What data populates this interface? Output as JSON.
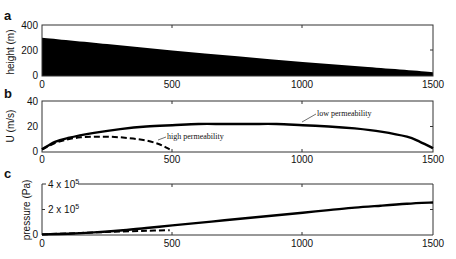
{
  "chart_data": [
    {
      "panel": "a",
      "type": "area",
      "title": "",
      "xlabel": "",
      "ylabel": "height (m)",
      "xlim": [
        0,
        1500
      ],
      "ylim": [
        0,
        400
      ],
      "xticks": [
        0,
        500,
        1000,
        1500
      ],
      "yticks": [
        0,
        200,
        400
      ],
      "grid": false,
      "series": [
        {
          "name": "height",
          "style": "filled-black",
          "x": [
            0,
            250,
            500,
            750,
            1000,
            1250,
            1500
          ],
          "y": [
            300,
            250,
            200,
            155,
            110,
            70,
            30
          ]
        }
      ]
    },
    {
      "panel": "b",
      "type": "line",
      "title": "",
      "xlabel": "",
      "ylabel": "U (m/s)",
      "xlim": [
        0,
        1500
      ],
      "ylim": [
        0,
        40
      ],
      "xticks": [
        0,
        500,
        1000,
        1500
      ],
      "yticks": [
        0,
        20,
        40
      ],
      "grid": false,
      "series": [
        {
          "name": "low permeability",
          "style": "solid",
          "x": [
            0,
            50,
            100,
            200,
            300,
            400,
            500,
            600,
            700,
            800,
            900,
            1000,
            1100,
            1200,
            1300,
            1400,
            1450,
            1500
          ],
          "y": [
            2,
            8,
            11,
            15,
            18,
            20,
            21,
            22,
            22,
            22,
            22,
            21,
            20,
            18.5,
            16,
            12,
            8,
            3
          ]
        },
        {
          "name": "high permeability",
          "style": "dashed",
          "x": [
            0,
            50,
            100,
            150,
            200,
            250,
            300,
            350,
            400,
            450,
            490
          ],
          "y": [
            2,
            7,
            10,
            11.5,
            12,
            12,
            11.5,
            10.5,
            9,
            6,
            2
          ]
        }
      ],
      "annotations": [
        {
          "text": "low permeability",
          "x": 1000,
          "y": 21
        },
        {
          "text": "high permeability",
          "x": 490,
          "y": 12
        }
      ]
    },
    {
      "panel": "c",
      "type": "line",
      "title": "",
      "xlabel": "",
      "ylabel": "pressure (Pa)",
      "xlim": [
        0,
        1500
      ],
      "ylim": [
        0,
        400000
      ],
      "xticks": [
        0,
        500,
        1000,
        1500
      ],
      "yticks": [
        0,
        200000,
        400000
      ],
      "ytick_labels": [
        "0",
        "2 x 10^5",
        "4 x 10^5"
      ],
      "grid": false,
      "series": [
        {
          "name": "low permeability",
          "style": "solid",
          "x": [
            0,
            100,
            200,
            300,
            400,
            500,
            600,
            700,
            800,
            900,
            1000,
            1100,
            1200,
            1300,
            1400,
            1500
          ],
          "y": [
            5000,
            10000,
            20000,
            35000,
            55000,
            75000,
            95000,
            115000,
            135000,
            155000,
            175000,
            195000,
            215000,
            230000,
            245000,
            255000
          ]
        },
        {
          "name": "high permeability",
          "style": "dashed",
          "x": [
            0,
            100,
            200,
            300,
            400,
            490
          ],
          "y": [
            5000,
            12000,
            20000,
            27000,
            33000,
            38000
          ]
        }
      ]
    }
  ],
  "labels": {
    "panel_a": "a",
    "panel_b": "b",
    "panel_c": "c",
    "ylabel_a": "height (m)",
    "ylabel_b": "U (m/s)",
    "ylabel_c": "pressure (Pa)",
    "xticks": [
      "0",
      "500",
      "1000",
      "1500"
    ],
    "yticks_a": [
      "0",
      "200",
      "400"
    ],
    "yticks_b": [
      "0",
      "20",
      "40"
    ],
    "yticks_c_0": "0",
    "yticks_c_2_base": "2 x 10",
    "yticks_c_4_base": "4 x 10",
    "yticks_c_exp": "5",
    "annot_low": "low permeability",
    "annot_high": "high permeability"
  }
}
